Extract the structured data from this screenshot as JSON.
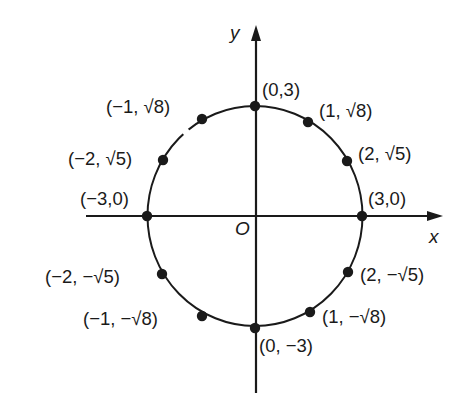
{
  "diagram": {
    "colors": {
      "ink": "#1a1a1a",
      "background": "#ffffff"
    },
    "axes": {
      "x_label": "x",
      "y_label": "y",
      "origin_label": "O"
    },
    "points": [
      {
        "label": "(0,3)",
        "x": 0,
        "y": "3"
      },
      {
        "label": "(1, √8)",
        "x": 1,
        "y": "√8"
      },
      {
        "label": "(2, √5)",
        "x": 2,
        "y": "√5"
      },
      {
        "label": "(3,0)",
        "x": 3,
        "y": "0"
      },
      {
        "label": "(2, −√5)",
        "x": 2,
        "y": "−√5"
      },
      {
        "label": "(1, −√8)",
        "x": 1,
        "y": "−√8"
      },
      {
        "label": "(0, −3)",
        "x": 0,
        "y": "−3"
      },
      {
        "label": "(−1, −√8)",
        "x": -1,
        "y": "−√8"
      },
      {
        "label": "(−2, −√5)",
        "x": -2,
        "y": "−√5"
      },
      {
        "label": "(−3,0)",
        "x": -3,
        "y": "0"
      },
      {
        "label": "(−2, √5)",
        "x": -2,
        "y": "√5"
      },
      {
        "label": "(−1, √8)",
        "x": -1,
        "y": "√8"
      }
    ]
  }
}
